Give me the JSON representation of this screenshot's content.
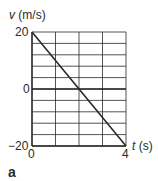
{
  "chart_data": {
    "type": "line",
    "title": "",
    "xlabel": "t (s)",
    "ylabel": "v (m/s)",
    "xlabel_var": "t",
    "xlabel_unit": "(s)",
    "ylabel_var": "v",
    "ylabel_unit": "(m/s)",
    "xlim": [
      0,
      4
    ],
    "ylim": [
      -20,
      20
    ],
    "x_ticks": [
      0,
      4
    ],
    "y_ticks": [
      -20,
      0,
      20
    ],
    "x_tick_labels": [
      "0",
      "4"
    ],
    "y_tick_labels": [
      "−20",
      "0",
      "20"
    ],
    "grid": true,
    "grid_x_step": 1,
    "grid_y_step": 4,
    "legend": null,
    "series": [
      {
        "name": "velocity",
        "x": [
          0,
          1,
          2,
          3,
          4
        ],
        "y": [
          20,
          10,
          0,
          -10,
          -20
        ],
        "color": "#2a2a2a"
      }
    ],
    "panel_label": "a"
  },
  "labels": {
    "y_var": "v",
    "y_unit": "(m/s)",
    "x_var": "t",
    "x_unit": "(s)",
    "y_top": "20",
    "y_mid": "0",
    "y_bottom": "−20",
    "x_left": "0",
    "x_right": "4",
    "panel": "a"
  }
}
